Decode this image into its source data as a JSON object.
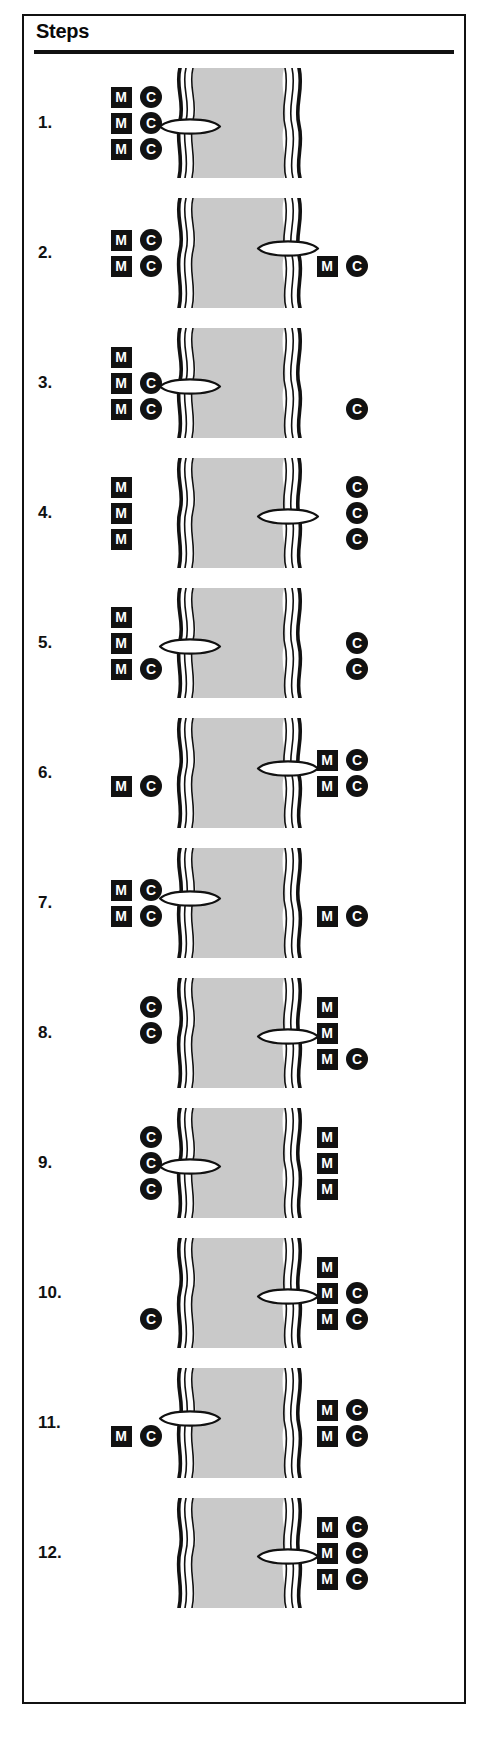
{
  "header": {
    "title": "Steps"
  },
  "icons": {
    "m_label": "M",
    "c_label": "C",
    "m_icon_name": "methyl-square-icon",
    "c_icon_name": "carrier-circle-icon",
    "vesicle_icon_name": "vesicle-lens-icon",
    "membrane_icon_name": "membrane-icon"
  },
  "colors": {
    "ink": "#111111",
    "membrane_fill": "#c9c9c9",
    "page": "#ffffff",
    "glyph_text": "#ffffff"
  },
  "diagram": {
    "type": "process-sequence",
    "step_count": 12,
    "description_note": "Membrane transport sequence with M squares and C circles on left and right sides of a membrane, plus a lens-shaped vesicle at varying positions."
  },
  "steps": [
    {
      "number": "1.",
      "left": [
        {
          "m": "M",
          "c": "C"
        },
        {
          "m": "M",
          "c": "C"
        },
        {
          "m": "M",
          "c": "C"
        }
      ],
      "right": [],
      "vesicle": {
        "side": "left",
        "row": 1
      }
    },
    {
      "number": "2.",
      "left": [
        {
          "m": "M",
          "c": "C"
        },
        {
          "m": "M",
          "c": "C"
        }
      ],
      "right": [
        {
          "m": "",
          "c": ""
        },
        {
          "m": "M",
          "c": "C"
        }
      ],
      "vesicle": {
        "side": "right",
        "row": 0
      }
    },
    {
      "number": "3.",
      "left": [
        {
          "m": "M",
          "c": ""
        },
        {
          "m": "M",
          "c": "C"
        },
        {
          "m": "M",
          "c": "C"
        }
      ],
      "right": [
        {
          "m": "",
          "c": ""
        },
        {
          "m": "",
          "c": ""
        },
        {
          "m": "",
          "c": "C"
        }
      ],
      "vesicle": {
        "side": "left",
        "row": 1
      }
    },
    {
      "number": "4.",
      "left": [
        {
          "m": "M",
          "c": ""
        },
        {
          "m": "M",
          "c": ""
        },
        {
          "m": "M",
          "c": ""
        }
      ],
      "right": [
        {
          "m": "",
          "c": "C"
        },
        {
          "m": "",
          "c": "C"
        },
        {
          "m": "",
          "c": "C"
        }
      ],
      "vesicle": {
        "side": "right",
        "row": 1
      }
    },
    {
      "number": "5.",
      "left": [
        {
          "m": "M",
          "c": ""
        },
        {
          "m": "M",
          "c": ""
        },
        {
          "m": "M",
          "c": "C"
        }
      ],
      "right": [
        {
          "m": "",
          "c": ""
        },
        {
          "m": "",
          "c": "C"
        },
        {
          "m": "",
          "c": "C"
        }
      ],
      "vesicle": {
        "side": "left",
        "row": 1
      }
    },
    {
      "number": "6.",
      "left": [
        {
          "m": "",
          "c": ""
        },
        {
          "m": "M",
          "c": "C"
        }
      ],
      "right": [
        {
          "m": "M",
          "c": "C"
        },
        {
          "m": "M",
          "c": "C"
        }
      ],
      "vesicle": {
        "side": "right",
        "row": 0
      }
    },
    {
      "number": "7.",
      "left": [
        {
          "m": "M",
          "c": "C"
        },
        {
          "m": "M",
          "c": "C"
        }
      ],
      "right": [
        {
          "m": "",
          "c": ""
        },
        {
          "m": "M",
          "c": "C"
        }
      ],
      "vesicle": {
        "side": "left",
        "row": 0
      }
    },
    {
      "number": "8.",
      "left": [
        {
          "m": "",
          "c": "C"
        },
        {
          "m": "",
          "c": "C"
        },
        {
          "m": "",
          "c": ""
        }
      ],
      "right": [
        {
          "m": "M",
          "c": ""
        },
        {
          "m": "M",
          "c": ""
        },
        {
          "m": "M",
          "c": "C"
        }
      ],
      "vesicle": {
        "side": "right",
        "row": 1
      }
    },
    {
      "number": "9.",
      "left": [
        {
          "m": "",
          "c": "C"
        },
        {
          "m": "",
          "c": "C"
        },
        {
          "m": "",
          "c": "C"
        }
      ],
      "right": [
        {
          "m": "M",
          "c": ""
        },
        {
          "m": "M",
          "c": ""
        },
        {
          "m": "M",
          "c": ""
        }
      ],
      "vesicle": {
        "side": "left",
        "row": 1
      }
    },
    {
      "number": "10.",
      "left": [
        {
          "m": "",
          "c": ""
        },
        {
          "m": "",
          "c": ""
        },
        {
          "m": "",
          "c": "C"
        }
      ],
      "right": [
        {
          "m": "M",
          "c": ""
        },
        {
          "m": "M",
          "c": "C"
        },
        {
          "m": "M",
          "c": "C"
        }
      ],
      "vesicle": {
        "side": "right",
        "row": 1
      }
    },
    {
      "number": "11.",
      "left": [
        {
          "m": "",
          "c": ""
        },
        {
          "m": "M",
          "c": "C"
        }
      ],
      "right": [
        {
          "m": "M",
          "c": "C"
        },
        {
          "m": "M",
          "c": "C"
        }
      ],
      "vesicle": {
        "side": "left",
        "row": 0
      }
    },
    {
      "number": "12.",
      "left": [],
      "right": [
        {
          "m": "M",
          "c": "C"
        },
        {
          "m": "M",
          "c": "C"
        },
        {
          "m": "M",
          "c": "C"
        }
      ],
      "vesicle": {
        "side": "right",
        "row": 1
      }
    }
  ]
}
